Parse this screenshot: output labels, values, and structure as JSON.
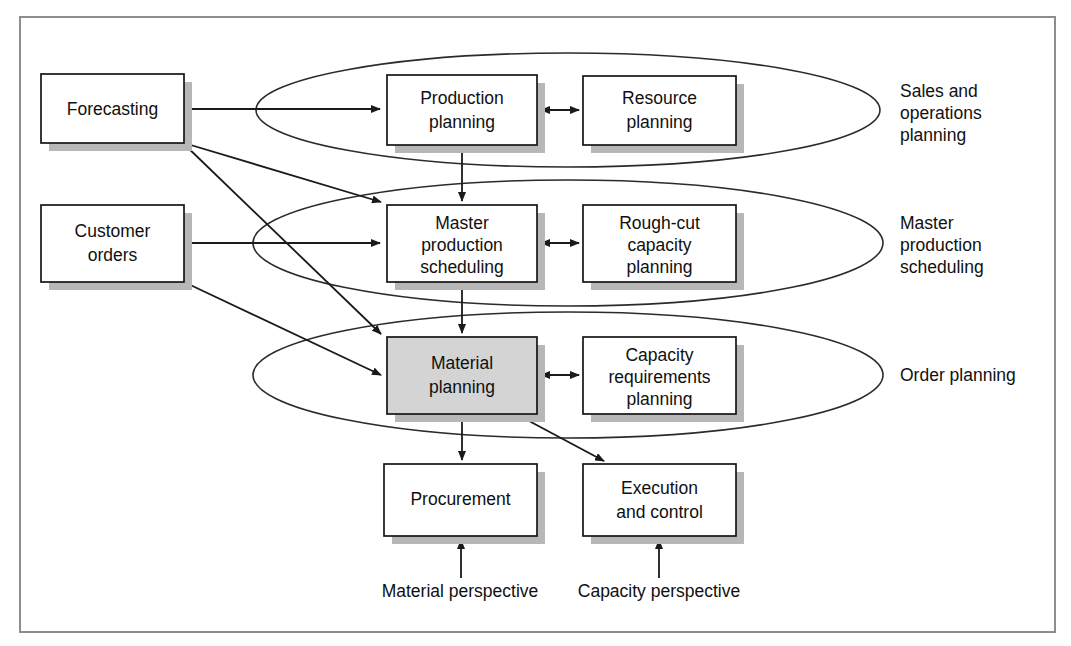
{
  "diagram": {
    "colors": {
      "frame_border": "#8d8d8d",
      "box_border": "#161616",
      "box_fill": "#ffffff",
      "highlight_fill": "#d4d4d4",
      "shadow": "#b7b7b7",
      "line": "#1a1a1a",
      "text": "#101010"
    },
    "frame": {
      "x": 20,
      "y": 17,
      "width": 1035,
      "height": 615
    },
    "input_nodes": [
      {
        "id": "forecasting",
        "label": "Forecasting",
        "lines": [
          "Forecasting"
        ],
        "x": 41,
        "y": 74,
        "width": 143,
        "height": 69,
        "fill": "plain"
      },
      {
        "id": "customer-orders",
        "label": "Customer orders",
        "lines": [
          "Customer",
          "orders"
        ],
        "x": 41,
        "y": 205,
        "width": 143,
        "height": 77,
        "fill": "plain"
      }
    ],
    "groups": [
      {
        "id": "sales-and-operations-planning",
        "label": "Sales and operations planning",
        "label_lines": [
          "Sales and",
          "operations",
          "planning"
        ],
        "label_x": 900,
        "label_y": 91,
        "ellipse": {
          "cx": 568,
          "cy": 110,
          "rx": 312,
          "ry": 57
        },
        "nodes": [
          {
            "id": "production-planning",
            "label": "Production planning",
            "lines": [
              "Production",
              "planning"
            ],
            "x": 387,
            "y": 75,
            "width": 150,
            "height": 70,
            "fill": "plain"
          },
          {
            "id": "resource-planning",
            "label": "Resource planning",
            "lines": [
              "Resource",
              "planning"
            ],
            "x": 583,
            "y": 76,
            "width": 153,
            "height": 69,
            "fill": "plain"
          }
        ]
      },
      {
        "id": "master-production-scheduling",
        "label": "Master production scheduling",
        "label_lines": [
          "Master",
          "production",
          "scheduling"
        ],
        "label_x": 900,
        "label_y": 222,
        "ellipse": {
          "cx": 568,
          "cy": 243,
          "rx": 315,
          "ry": 63
        },
        "nodes": [
          {
            "id": "master-production-scheduling-box",
            "label": "Master production scheduling",
            "lines": [
              "Master",
              "production",
              "scheduling"
            ],
            "x": 387,
            "y": 205,
            "width": 150,
            "height": 77,
            "fill": "plain"
          },
          {
            "id": "rough-cut-capacity-planning",
            "label": "Rough-cut capacity planning",
            "lines": [
              "Rough-cut",
              "capacity",
              "planning"
            ],
            "x": 583,
            "y": 205,
            "width": 153,
            "height": 77,
            "fill": "plain"
          }
        ]
      },
      {
        "id": "order-planning",
        "label": "Order planning",
        "label_lines": [
          "Order planning"
        ],
        "label_x": 900,
        "label_y": 381,
        "ellipse": {
          "cx": 568,
          "cy": 375,
          "rx": 315,
          "ry": 63
        },
        "nodes": [
          {
            "id": "material-planning",
            "label": "Material planning",
            "lines": [
              "Material",
              "planning"
            ],
            "x": 387,
            "y": 337,
            "width": 150,
            "height": 77,
            "fill": "shaded"
          },
          {
            "id": "capacity-requirements-planning",
            "label": "Capacity requirements planning",
            "lines": [
              "Capacity",
              "requirements",
              "planning"
            ],
            "x": 583,
            "y": 337,
            "width": 153,
            "height": 77,
            "fill": "plain"
          }
        ]
      }
    ],
    "output_nodes": [
      {
        "id": "procurement",
        "label": "Procurement",
        "lines": [
          "Procurement"
        ],
        "x": 384,
        "y": 464,
        "width": 153,
        "height": 72,
        "fill": "plain"
      },
      {
        "id": "execution-and-control",
        "label": "Execution and control",
        "lines": [
          "Execution",
          "and control"
        ],
        "x": 583,
        "y": 464,
        "width": 153,
        "height": 72,
        "fill": "plain"
      }
    ],
    "perspective_labels": [
      {
        "id": "material-perspective",
        "text": "Material perspective",
        "x": 460,
        "y": 596
      },
      {
        "id": "capacity-perspective",
        "text": "Capacity perspective",
        "x": 659,
        "y": 596
      }
    ],
    "connectors": [
      {
        "id": "forecasting-to-production-planning",
        "from": "forecasting",
        "to": "production-planning",
        "kind": "arrow"
      },
      {
        "id": "forecasting-to-master-production-scheduling",
        "from": "forecasting",
        "to": "master-production-scheduling-box",
        "kind": "arrow"
      },
      {
        "id": "forecasting-to-material-planning",
        "from": "forecasting",
        "to": "material-planning",
        "kind": "arrow"
      },
      {
        "id": "customer-orders-to-master-production-scheduling",
        "from": "customer-orders",
        "to": "master-production-scheduling-box",
        "kind": "arrow"
      },
      {
        "id": "customer-orders-to-material-planning",
        "from": "customer-orders",
        "to": "material-planning",
        "kind": "arrow"
      },
      {
        "id": "production-planning-to-resource-planning",
        "from": "production-planning",
        "to": "resource-planning",
        "kind": "double-arrow"
      },
      {
        "id": "master-production-scheduling-to-rough-cut",
        "from": "master-production-scheduling-box",
        "to": "rough-cut-capacity-planning",
        "kind": "double-arrow"
      },
      {
        "id": "material-planning-to-capacity-requirements",
        "from": "material-planning",
        "to": "capacity-requirements-planning",
        "kind": "double-arrow"
      },
      {
        "id": "production-planning-down-to-master-production-scheduling",
        "from": "production-planning",
        "to": "master-production-scheduling-box",
        "kind": "arrow"
      },
      {
        "id": "master-production-scheduling-down-to-material-planning",
        "from": "master-production-scheduling-box",
        "to": "material-planning",
        "kind": "arrow"
      },
      {
        "id": "material-planning-down-to-procurement",
        "from": "material-planning",
        "to": "procurement",
        "kind": "arrow"
      },
      {
        "id": "material-planning-to-execution-and-control",
        "from": "material-planning",
        "to": "execution-and-control",
        "kind": "arrow"
      },
      {
        "id": "material-perspective-to-procurement",
        "from": "material-perspective",
        "to": "procurement",
        "kind": "arrow"
      },
      {
        "id": "capacity-perspective-to-execution-and-control",
        "from": "capacity-perspective",
        "to": "execution-and-control",
        "kind": "arrow"
      }
    ]
  }
}
